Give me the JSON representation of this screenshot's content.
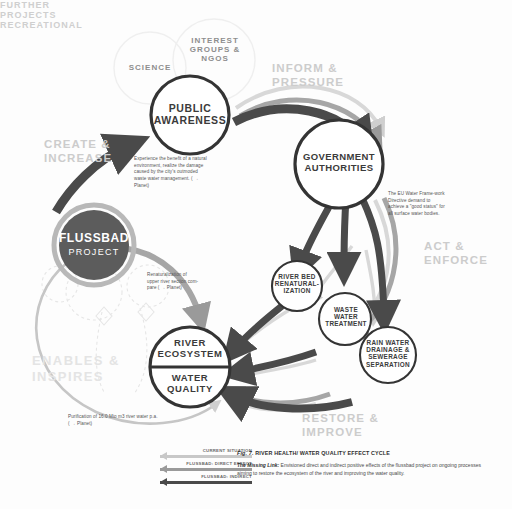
{
  "figure": {
    "title_prefix": "Fig. 7.",
    "title": "RIVER HEALTH/ WATER QUALITY EFFECT CYCLE",
    "caption_lead": "The Missing Link:",
    "caption_body": " Envisioned direct and indirect positive effects of the flussbad project on ongoing processes aiming to restore the ecosystem of the river and improving the water quality."
  },
  "nodes": {
    "public_awareness": {
      "line1": "PUBLIC",
      "line2": "AWARENESS"
    },
    "science": {
      "label": "SCIENCE"
    },
    "interest_groups": {
      "line1": "INTEREST",
      "line2": "GROUPS &",
      "line3": "NGOS"
    },
    "government": {
      "line1": "GOVERNMENT",
      "line2": "AUTHORITIES"
    },
    "flussbad": {
      "line1": "FLUSSBAD",
      "line2": "PROJECT"
    },
    "river_bed": {
      "line1": "RIVER BED",
      "line2": "RENATURAL-",
      "line3": "IZATION"
    },
    "waste_water": {
      "line1": "WASTE",
      "line2": "WATER",
      "line3": "TREATMENT"
    },
    "rain_water": {
      "line1": "RAIN WATER",
      "line2": "DRAINAGE &",
      "line3": "SEWERAGE",
      "line4": "SEPARATION"
    },
    "river_ecosystem": {
      "line1": "RIVER",
      "line2": "ECOSYSTEM"
    },
    "water_quality": {
      "line1": "WATER",
      "line2": "QUALITY"
    },
    "further_projects": {
      "word1": "FURTHER",
      "word2": "PROJECTS",
      "word3": "RECREATIONAL"
    }
  },
  "flows": {
    "create_increase": {
      "line1": "CREATE &",
      "line2": "INCREASE"
    },
    "inform_pressure": {
      "line1": "INFORM &",
      "line2": "PRESSURE"
    },
    "act_enforce": {
      "line1": "ACT &",
      "line2": "ENFORCE"
    },
    "restore_improve": {
      "line1": "RESTORE &",
      "line2": "IMPROVE"
    },
    "enables_inspires": {
      "line1": "ENABLES &",
      "line2": "INSPIRES"
    }
  },
  "notes": {
    "awareness_note": "Experience the benefit of a natural environment, realize the damage caused by the city's outmoded waste water management.  ( → Planet)",
    "eu_directive_note": "The EU Water Frame-work Directive demand to achieve a \"good status\" for all surface water bodies.",
    "renaturalization_note": "Renaturalization of upper river section com-pare ( → Planet)",
    "purification_note": "Purification of 16.0 Mio m3 river water p.a.  ( → Planet)"
  },
  "legend": {
    "items": [
      {
        "label": "CURRENT SITUATION",
        "color": "#c8c8c8"
      },
      {
        "label": "FLUSSBAD: DIRECT EFFECT",
        "color": "#9a9a9a"
      },
      {
        "label": "FLUSSBAD: INDIRECT",
        "color": "#4a4a4a"
      }
    ]
  },
  "colors": {
    "dark_arrow": "#4a4a4a",
    "mid_arrow": "#9a9a9a",
    "light_arrow": "#cfcfcf",
    "node_stroke": "#3a3a3a",
    "ghost_stroke": "#ececec",
    "flussbad_fill": "#5c5c5c",
    "flussbad_ring": "#b8b8b8"
  }
}
